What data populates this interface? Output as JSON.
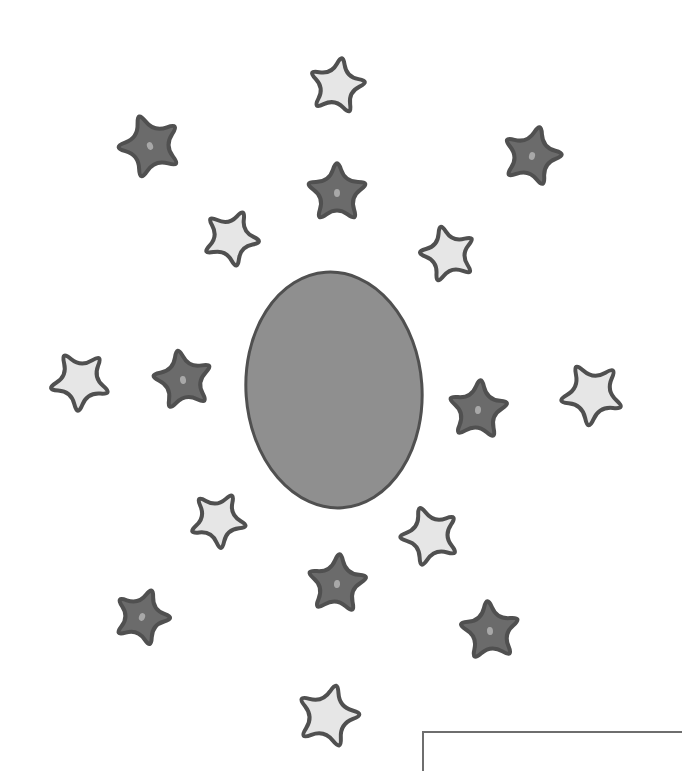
{
  "illustration": {
    "width": 672,
    "height": 749,
    "background": "#ffffff",
    "colors": {
      "outline": "#505050",
      "oval_fill": "#8f8f8f",
      "dark_star_fill": "#6b6b6b",
      "light_star_fill": "#e6e6e6",
      "star_center_dot": "#a8a8a8",
      "box_border": "#6e6e6e"
    },
    "oval": {
      "cx": 334,
      "cy": 390,
      "rx": 88,
      "ry": 118,
      "rotation": -4
    },
    "stars": [
      {
        "type": "light",
        "cx": 337,
        "cy": 86,
        "size": 34,
        "rotation": 10
      },
      {
        "type": "dark",
        "cx": 150,
        "cy": 146,
        "size": 38,
        "rotation": -20
      },
      {
        "type": "dark",
        "cx": 532,
        "cy": 156,
        "size": 36,
        "rotation": 15
      },
      {
        "type": "dark",
        "cx": 337,
        "cy": 193,
        "size": 36,
        "rotation": 0
      },
      {
        "type": "light",
        "cx": 231,
        "cy": 238,
        "size": 34,
        "rotation": 25
      },
      {
        "type": "light",
        "cx": 448,
        "cy": 254,
        "size": 34,
        "rotation": -15
      },
      {
        "type": "light",
        "cx": 80,
        "cy": 381,
        "size": 36,
        "rotation": 40
      },
      {
        "type": "dark",
        "cx": 183,
        "cy": 380,
        "size": 36,
        "rotation": -10
      },
      {
        "type": "dark",
        "cx": 478,
        "cy": 410,
        "size": 36,
        "rotation": 5
      },
      {
        "type": "light",
        "cx": 592,
        "cy": 394,
        "size": 38,
        "rotation": -30
      },
      {
        "type": "light",
        "cx": 218,
        "cy": 520,
        "size": 34,
        "rotation": 30
      },
      {
        "type": "light",
        "cx": 430,
        "cy": 536,
        "size": 36,
        "rotation": -20
      },
      {
        "type": "dark",
        "cx": 337,
        "cy": 584,
        "size": 36,
        "rotation": 5
      },
      {
        "type": "dark",
        "cx": 142,
        "cy": 617,
        "size": 34,
        "rotation": 20
      },
      {
        "type": "dark",
        "cx": 490,
        "cy": 631,
        "size": 36,
        "rotation": -5
      },
      {
        "type": "light",
        "cx": 328,
        "cy": 716,
        "size": 38,
        "rotation": 15
      }
    ],
    "box": {
      "x": 422,
      "y": 731
    }
  }
}
